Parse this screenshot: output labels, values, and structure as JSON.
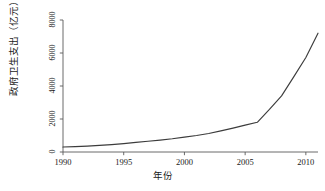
{
  "chart_data": {
    "type": "line",
    "title": "",
    "xlabel": "年份",
    "ylabel": "政府卫生支出（亿元）",
    "xlim": [
      1990,
      2011
    ],
    "ylim": [
      0,
      8000
    ],
    "grid": false,
    "legend": "none",
    "xticks": [
      "1990",
      "1995",
      "2000",
      "2005",
      "2010"
    ],
    "xtick_values": [
      1990,
      1995,
      2000,
      2005,
      2010
    ],
    "yticks": [
      "0",
      "2000",
      "4000",
      "6000",
      "8000"
    ],
    "ytick_values": [
      0,
      2000,
      4000,
      6000,
      8000
    ],
    "line_color": "#3c3c3c",
    "x": [
      1990,
      1991,
      1992,
      1993,
      1994,
      1995,
      1996,
      1997,
      1998,
      1999,
      2000,
      2001,
      2002,
      2003,
      2004,
      2005,
      2006,
      2007,
      2008,
      2009,
      2010,
      2011
    ],
    "values": [
      300,
      330,
      360,
      400,
      450,
      510,
      580,
      650,
      720,
      800,
      900,
      1000,
      1120,
      1280,
      1450,
      1630,
      1800,
      2580,
      3400,
      4550,
      5730,
      7200
    ],
    "series": [
      {
        "name": "政府卫生支出",
        "values": [
          300,
          330,
          360,
          400,
          450,
          510,
          580,
          650,
          720,
          800,
          900,
          1000,
          1120,
          1280,
          1450,
          1630,
          1800,
          2580,
          3400,
          4550,
          5730,
          7200
        ]
      }
    ]
  }
}
